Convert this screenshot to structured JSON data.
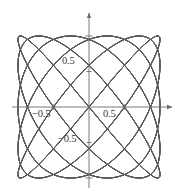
{
  "figure": {
    "title": "",
    "background_color": "#ffffff",
    "curve_color": "#4a4a4a",
    "axis_color": "#6b6b6b",
    "label_color": "#3a3a3a"
  },
  "axes": {
    "x_axis_name": "x-axis",
    "y_axis_name": "y-axis",
    "origin_px": [
      89,
      107
    ],
    "unit_px": 71,
    "x_arrow": "arrow-right",
    "y_arrow": "arrow-up",
    "ticks": {
      "x": [
        -1,
        -0.5,
        0.5,
        1
      ],
      "y": [
        -1,
        -0.5,
        0.5,
        1
      ]
    },
    "labels": {
      "x_neg_half": "−0.5",
      "x_pos_half": "0.5",
      "y_pos_half": "0.5",
      "y_neg_half": "−0.5"
    }
  },
  "chart_data": {
    "type": "line",
    "title": "",
    "xlabel": "",
    "ylabel": "",
    "xlim": [
      -1.15,
      1.15
    ],
    "ylim": [
      -1.15,
      1.15
    ],
    "grid": false,
    "legend_position": "none",
    "xticks": [
      -0.5,
      0.5
    ],
    "yticks": [
      -0.5,
      0.5
    ],
    "xticklabels": [
      "−0.5",
      "0.5"
    ],
    "yticklabels": [
      "−0.5",
      "0.5"
    ],
    "series": [
      {
        "name": "lissajous-1",
        "a": 5,
        "b": 6,
        "phase": 0.0,
        "amplitude_x": 1.0,
        "amplitude_y": 1.0
      },
      {
        "name": "lissajous-2",
        "a": 5,
        "b": 6,
        "phase": 0.524,
        "amplitude_x": 1.0,
        "amplitude_y": 1.0
      },
      {
        "name": "lissajous-3",
        "a": 5,
        "b": 6,
        "phase": 1.047,
        "amplitude_x": 1.0,
        "amplitude_y": 1.0
      },
      {
        "name": "lissajous-4",
        "a": 5,
        "b": 6,
        "phase": 1.571,
        "amplitude_x": 1.0,
        "amplitude_y": 1.0
      },
      {
        "name": "lissajous-5",
        "a": 5,
        "b": 6,
        "phase": 2.094,
        "amplitude_x": 1.0,
        "amplitude_y": 1.0
      },
      {
        "name": "lissajous-6",
        "a": 5,
        "b": 6,
        "phase": 2.618,
        "amplitude_x": 1.0,
        "amplitude_y": 1.0
      }
    ]
  }
}
